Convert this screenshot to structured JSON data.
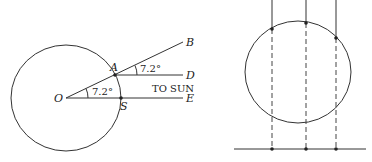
{
  "left_diagram": {
    "points": {
      "O": "O",
      "A": "A",
      "S": "S",
      "B": "B",
      "D": "D",
      "E": "E"
    },
    "angle_at_O": "7.2°",
    "angle_at_A": "7.2°",
    "sun_label": "TO SUN"
  },
  "right_diagram": {
    "vertical_lines": 3,
    "description": "Parallel rays hitting a circle, dashed projections to baseline"
  },
  "colors": {
    "stroke": "#333333",
    "background": "#ffffff"
  }
}
